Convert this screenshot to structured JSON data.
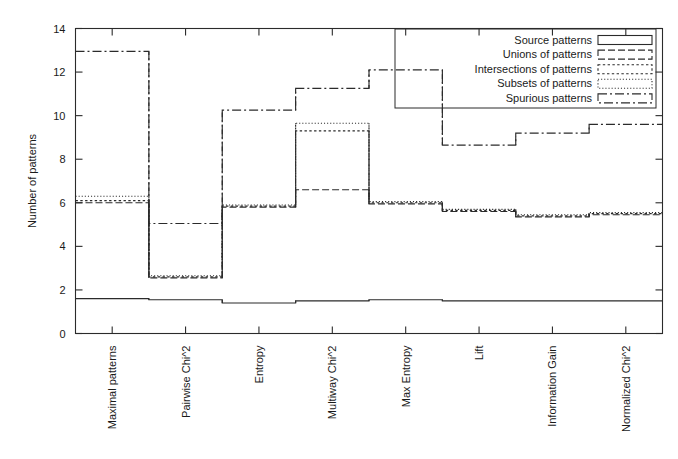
{
  "chart_data": {
    "type": "line",
    "title": "",
    "subtitle": "",
    "xlabel": "",
    "ylabel": "Number of patterns",
    "ylim": [
      0,
      14
    ],
    "yticks": [
      0,
      2,
      4,
      6,
      8,
      10,
      12,
      14
    ],
    "grid": false,
    "legend_position": "top-right",
    "style_note": "gnuplot steps/histeps style; each series drawn as a horizontal step across 8 category bins",
    "categories": [
      "Maximal patterns",
      "Pairwise Chi^2",
      "Entropy",
      "Multiway Chi^2",
      "Max Entropy",
      "Lift",
      "Information Gain",
      "Normalized Chi^2"
    ],
    "series": [
      {
        "name": "Source patterns",
        "dash": "solid",
        "values": [
          1.6,
          1.55,
          1.4,
          1.5,
          1.55,
          1.5,
          1.5,
          1.5
        ]
      },
      {
        "name": "Unions of patterns",
        "dash": "dashed",
        "values": [
          6.0,
          2.55,
          5.8,
          6.6,
          5.95,
          5.6,
          5.35,
          5.45
        ]
      },
      {
        "name": "Intersections of patterns",
        "dash": "dotted",
        "values": [
          6.1,
          2.6,
          5.85,
          9.3,
          6.0,
          5.65,
          5.4,
          5.5
        ]
      },
      {
        "name": "Subsets of patterns",
        "dash": "fine-dotted",
        "values": [
          6.3,
          2.65,
          5.9,
          9.65,
          6.05,
          5.7,
          5.45,
          5.55
        ]
      },
      {
        "name": "Spurious patterns",
        "dash": "dash-dot",
        "values": [
          12.95,
          5.05,
          10.25,
          11.25,
          12.1,
          8.65,
          9.2,
          9.6
        ]
      }
    ]
  },
  "legend": {
    "entries": [
      {
        "label": "Source patterns"
      },
      {
        "label": "Unions of patterns"
      },
      {
        "label": "Intersections of patterns"
      },
      {
        "label": "Subsets of patterns"
      },
      {
        "label": "Spurious patterns"
      }
    ]
  },
  "axes": {
    "y_title": "Number of patterns",
    "y_tick_labels": [
      "0",
      "2",
      "4",
      "6",
      "8",
      "10",
      "12",
      "14"
    ],
    "x_tick_labels": [
      "Maximal patterns",
      "Pairwise Chi^2",
      "Entropy",
      "Multiway Chi^2",
      "Max Entropy",
      "Lift",
      "Information Gain",
      "Normalized Chi^2"
    ]
  },
  "colors": {
    "ink": "#2b2b2b",
    "background": "#ffffff"
  }
}
